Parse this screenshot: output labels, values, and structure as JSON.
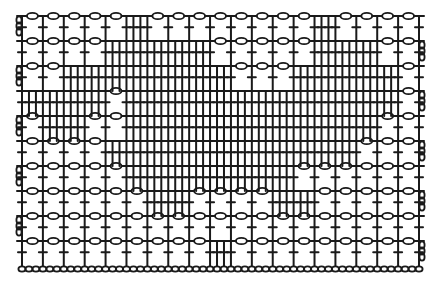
{
  "diagram": {
    "type": "filet-crochet-chart",
    "columns": 19,
    "rows": 10,
    "ink_color": "#1a1a1a",
    "background": "#ffffff",
    "legend": {
      "0": "open mesh (chain loop + double crochet)",
      "1": "filled block (double crochets)"
    },
    "pattern": [
      [
        0,
        0,
        0,
        0,
        0,
        1,
        0,
        0,
        0,
        0,
        0,
        0,
        0,
        0,
        1,
        0,
        0,
        0,
        0
      ],
      [
        0,
        0,
        0,
        0,
        1,
        1,
        1,
        1,
        1,
        0,
        0,
        0,
        0,
        0,
        1,
        1,
        1,
        0,
        0
      ],
      [
        0,
        0,
        1,
        1,
        1,
        1,
        1,
        1,
        1,
        1,
        0,
        0,
        0,
        1,
        1,
        1,
        1,
        1,
        0
      ],
      [
        1,
        1,
        1,
        1,
        0,
        1,
        1,
        1,
        1,
        1,
        1,
        1,
        1,
        1,
        1,
        1,
        1,
        1,
        0
      ],
      [
        0,
        1,
        1,
        0,
        0,
        1,
        1,
        1,
        1,
        1,
        1,
        1,
        1,
        1,
        1,
        1,
        1,
        0,
        0
      ],
      [
        0,
        0,
        0,
        0,
        1,
        1,
        1,
        1,
        1,
        1,
        1,
        1,
        1,
        1,
        1,
        1,
        0,
        0,
        0
      ],
      [
        0,
        0,
        0,
        0,
        0,
        1,
        1,
        1,
        1,
        1,
        1,
        1,
        1,
        0,
        0,
        0,
        0,
        0,
        0
      ],
      [
        0,
        0,
        0,
        0,
        0,
        0,
        1,
        1,
        0,
        0,
        0,
        0,
        1,
        1,
        0,
        0,
        0,
        0,
        0
      ],
      [
        0,
        0,
        0,
        0,
        0,
        0,
        0,
        0,
        0,
        0,
        0,
        0,
        0,
        0,
        0,
        0,
        0,
        0,
        0
      ],
      [
        0,
        0,
        0,
        0,
        0,
        0,
        0,
        0,
        0,
        1,
        0,
        0,
        0,
        0,
        0,
        0,
        0,
        0,
        0
      ]
    ],
    "foundation_chain": true
  }
}
